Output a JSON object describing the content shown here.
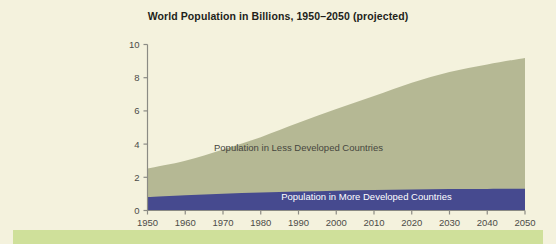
{
  "figure": {
    "background_color": "#f4f2dd",
    "footer_band_color": "#cfe09a",
    "title": "World Population in Billions, 1950–2050 (projected)"
  },
  "chart_data": {
    "type": "area",
    "stacked": true,
    "title": "World Population in Billions, 1950–2050 (projected)",
    "xlabel": "",
    "ylabel": "",
    "xlim": [
      1950,
      2050
    ],
    "ylim": [
      0,
      10
    ],
    "grid": false,
    "legend_position": "inline-annotation",
    "x": [
      1950,
      1960,
      1970,
      1980,
      1990,
      2000,
      2010,
      2020,
      2030,
      2040,
      2050
    ],
    "xticks": [
      "1950",
      "1960",
      "1970",
      "1980",
      "1990",
      "2000",
      "2010",
      "2020",
      "2030",
      "2040",
      "2050"
    ],
    "yticks": [
      "0",
      "2",
      "4",
      "6",
      "8",
      "10"
    ],
    "ytick_values": [
      0,
      2,
      4,
      6,
      8,
      10
    ],
    "series": [
      {
        "name": "Population in More Developed Countries",
        "color": "#464a8f",
        "label_color": "#ffffff",
        "values": [
          0.81,
          0.92,
          1.01,
          1.08,
          1.14,
          1.19,
          1.23,
          1.27,
          1.29,
          1.3,
          1.31
        ]
      },
      {
        "name": "Population in Less Developed Countries",
        "color": "#b5b894",
        "label_color": "#46463e",
        "values": [
          1.72,
          2.08,
          2.67,
          3.34,
          4.14,
          4.92,
          5.67,
          6.43,
          7.05,
          7.5,
          7.88
        ]
      }
    ],
    "totals": [
      2.53,
      3.0,
      3.68,
      4.42,
      5.28,
      6.11,
      6.9,
      7.7,
      8.34,
      8.8,
      9.19
    ],
    "annotations": [
      {
        "text": "Population in Less Developed Countries",
        "x": 1990,
        "y": 3.6
      },
      {
        "text": "Population in More Developed Countries",
        "x": 2008,
        "y": 0.62
      }
    ],
    "axis_color": "#8b8b84",
    "tick_label_color": "#4c4c48"
  }
}
